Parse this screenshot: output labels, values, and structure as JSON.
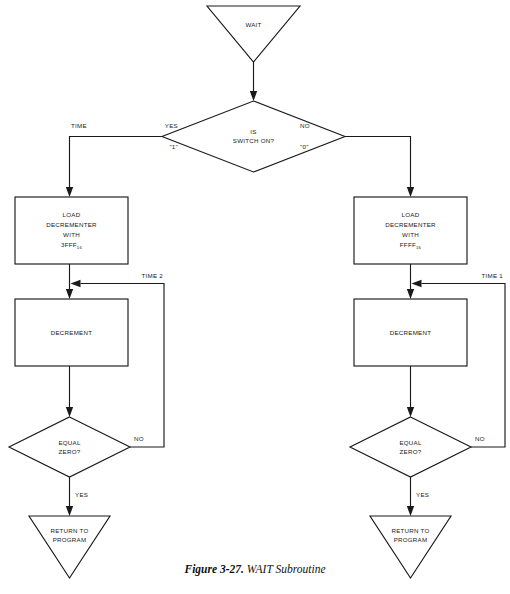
{
  "figure": {
    "caption_label": "Figure 3-27.",
    "caption_title": "WAIT Subroutine"
  },
  "nodes": {
    "start": {
      "label": "WAIT",
      "shape": "inverted-triangle"
    },
    "decision_switch": {
      "line1": "IS",
      "line2": "SWITCH ON?",
      "shape": "diamond"
    },
    "load_left": {
      "line1": "LOAD",
      "line2": "DECREMENTER",
      "line3": "WITH",
      "value": "3FFF",
      "subscript": "16",
      "shape": "process"
    },
    "load_right": {
      "line1": "LOAD",
      "line2": "DECREMENTER",
      "line3": "WITH",
      "value": "FFFF",
      "subscript": "16",
      "shape": "process"
    },
    "decrement_left": {
      "label": "DECREMENT",
      "shape": "process"
    },
    "decrement_right": {
      "label": "DECREMENT",
      "shape": "process"
    },
    "zero_left": {
      "line1": "EQUAL",
      "line2": "ZERO?",
      "shape": "diamond"
    },
    "zero_right": {
      "line1": "EQUAL",
      "line2": "ZERO?",
      "shape": "diamond"
    },
    "return_left": {
      "line1": "RETURN TO",
      "line2": "PROGRAM",
      "shape": "inverted-triangle"
    },
    "return_right": {
      "line1": "RETURN TO",
      "line2": "PROGRAM",
      "shape": "inverted-triangle"
    }
  },
  "edges": {
    "time_left": "TIME",
    "branch_yes": "YES",
    "branch_yes_value": "\"1\"",
    "branch_no": "NO",
    "branch_no_value": "\"0\"",
    "loop_left": "TIME 2",
    "loop_right": "TIME 1",
    "zero_left_no": "NO",
    "zero_left_yes": "YES",
    "zero_right_no": "NO",
    "zero_right_yes": "YES"
  },
  "style": {
    "line_color": "#1a1a1a",
    "fill_color": "#ffffff",
    "background": "#ffffff"
  }
}
